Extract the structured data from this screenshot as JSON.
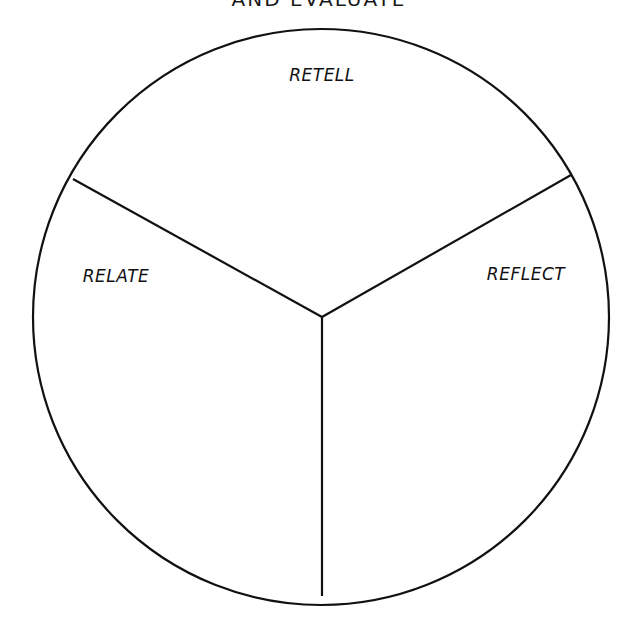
{
  "title": "AND EVALUATE",
  "colors": {
    "stroke": "#111111",
    "background": "#ffffff"
  },
  "circle": {
    "cx": 321,
    "cy": 317,
    "r": 288
  },
  "center": {
    "x": 322,
    "y": 317
  },
  "sections": [
    {
      "label": "RETELL",
      "label_x": 322,
      "label_y": 81
    },
    {
      "label": "RELATE",
      "label_x": 116,
      "label_y": 282
    },
    {
      "label": "REFLECT",
      "label_x": 526,
      "label_y": 280
    }
  ],
  "spokes": [
    {
      "x": 73,
      "y": 179
    },
    {
      "x": 571,
      "y": 175
    },
    {
      "x": 322,
      "y": 596
    }
  ]
}
